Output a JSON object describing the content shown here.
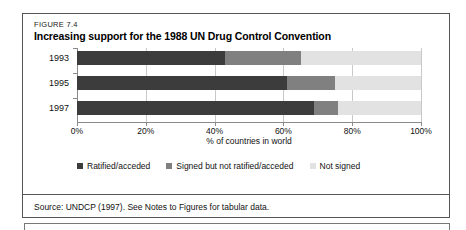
{
  "figure": {
    "label": "FIGURE 7.4",
    "title": "Increasing support for the 1988 UN Drug Control Convention",
    "source": "Source: UNDCP (1997). See Notes to Figures for tabular data."
  },
  "colors": {
    "ratified": "#3c3c3c",
    "signed": "#808080",
    "not_signed": "#e2e2e2",
    "axis": "#8a8a8a",
    "grid": "#c9c9c9",
    "border": "#555555"
  },
  "chart_data": {
    "type": "bar",
    "orientation": "horizontal",
    "stacked": true,
    "stacked_percent": true,
    "title": "Increasing support for the 1988 UN Drug Control Convention",
    "subtitle": "FIGURE 7.4",
    "xlabel": "% of countries in world",
    "ylabel": "",
    "xlim": [
      0,
      100
    ],
    "xticks": [
      0,
      20,
      40,
      60,
      80,
      100
    ],
    "xtick_labels": [
      "0%",
      "20%",
      "40%",
      "60%",
      "80%",
      "100%"
    ],
    "categories": [
      "1993",
      "1995",
      "1997"
    ],
    "grid": true,
    "legend_position": "bottom",
    "series": [
      {
        "name": "Ratified/acceded",
        "color": "#3c3c3c",
        "values": [
          43,
          61,
          69
        ]
      },
      {
        "name": "Signed but not ratified/acceded",
        "color": "#808080",
        "values": [
          22,
          14,
          7
        ]
      },
      {
        "name": "Not signed",
        "color": "#e2e2e2",
        "values": [
          35,
          25,
          24
        ]
      }
    ]
  }
}
